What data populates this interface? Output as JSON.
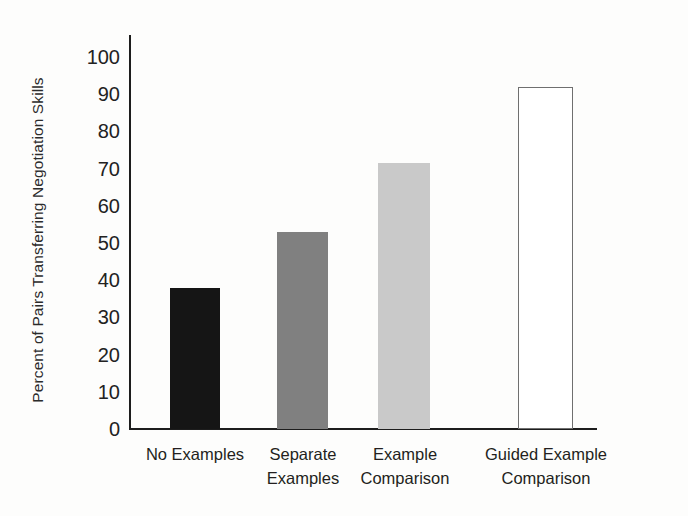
{
  "chart_data": {
    "type": "bar",
    "title": "",
    "subtitle": "",
    "xlabel": "",
    "ylabel": "Percent of Pairs Transferring Negotiation Skills",
    "categories": [
      "No Examples",
      "Separate\nExamples",
      "Example\nComparison",
      "Guided Example\nComparison"
    ],
    "values": [
      38,
      53,
      71.5,
      92
    ],
    "ylim": [
      0,
      100
    ],
    "yticks": [
      0,
      10,
      20,
      30,
      40,
      50,
      60,
      70,
      80,
      90,
      100
    ],
    "ytick_labels": [
      "0",
      "10",
      "20",
      "30",
      "40",
      "50",
      "60",
      "70",
      "80",
      "90",
      "100"
    ],
    "grid": false,
    "legend": "none",
    "bar_colors": [
      "#151515",
      "#808080",
      "#c9c9c9",
      "#ffffff"
    ],
    "bar_edge_colors": [
      "#151515",
      "#808080",
      "#c9c9c9",
      "#6f6f6f"
    ],
    "axis_color": "#1d1d1d",
    "background_color": "#fdfdfc"
  },
  "axis": {
    "y_title": "Percent of Pairs Transferring Negotiation Skills"
  }
}
